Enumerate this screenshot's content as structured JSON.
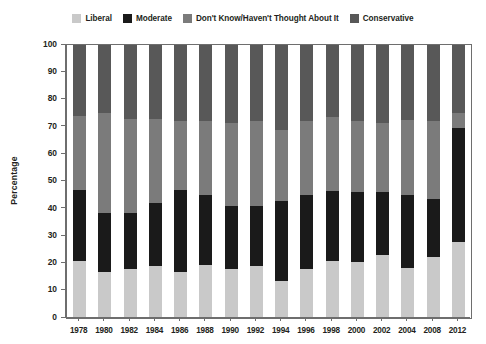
{
  "legend": {
    "entries": [
      {
        "label": "Liberal",
        "color": "#c9c9c9",
        "icon": "legend-swatch-liberal"
      },
      {
        "label": "Moderate",
        "color": "#1a1a1a",
        "icon": "legend-swatch-moderate"
      },
      {
        "label": "Don't Know/Haven't Thought About It",
        "color": "#7b7b7b",
        "icon": "legend-swatch-dont-know"
      },
      {
        "label": "Conservative",
        "color": "#585858",
        "icon": "legend-swatch-conservative"
      }
    ]
  },
  "chart_data": {
    "type": "bar",
    "stacked": true,
    "stack_total": 100,
    "title": "",
    "subtitle": "",
    "xlabel": "",
    "ylabel": "Percentage",
    "ylim": [
      0,
      100
    ],
    "yticks": [
      0,
      10,
      20,
      30,
      40,
      50,
      60,
      70,
      80,
      90,
      100
    ],
    "ytick_labels": [
      "0",
      "10",
      "20",
      "30",
      "40",
      "50",
      "60",
      "70",
      "80",
      "90",
      "100"
    ],
    "grid": false,
    "legend_position": "top",
    "categories": [
      "1978",
      "1980",
      "1982",
      "1984",
      "1986",
      "1988",
      "1990",
      "1992",
      "1994",
      "1996",
      "1998",
      "2000",
      "2002",
      "2004",
      "2008",
      "2012"
    ],
    "series": [
      {
        "name": "Liberal",
        "color": "#c9c9c9",
        "values": [
          21,
          17,
          18,
          19,
          17,
          19.5,
          18,
          19,
          13.5,
          18,
          21,
          20.5,
          23,
          18.5,
          22.5,
          28
        ]
      },
      {
        "name": "Moderate",
        "color": "#1a1a1a",
        "values": [
          26,
          21.5,
          20.5,
          23,
          30,
          25.5,
          23,
          22,
          29.5,
          27,
          25.5,
          25.5,
          23,
          26.5,
          21,
          41.5
        ]
      },
      {
        "name": "Don't Know/Haven't Thought About It",
        "color": "#7b7b7b",
        "values": [
          27,
          36.5,
          34.5,
          31,
          25,
          27,
          30.5,
          31,
          26,
          27,
          27,
          26,
          25.5,
          27.5,
          28.5,
          5.5
        ]
      },
      {
        "name": "Conservative",
        "color": "#585858",
        "values": [
          26,
          25,
          27,
          27,
          28,
          28,
          28.5,
          28,
          31,
          28,
          26.5,
          28,
          28.5,
          27.5,
          28,
          25
        ]
      }
    ]
  },
  "axis": {
    "y_title": "Percentage"
  }
}
